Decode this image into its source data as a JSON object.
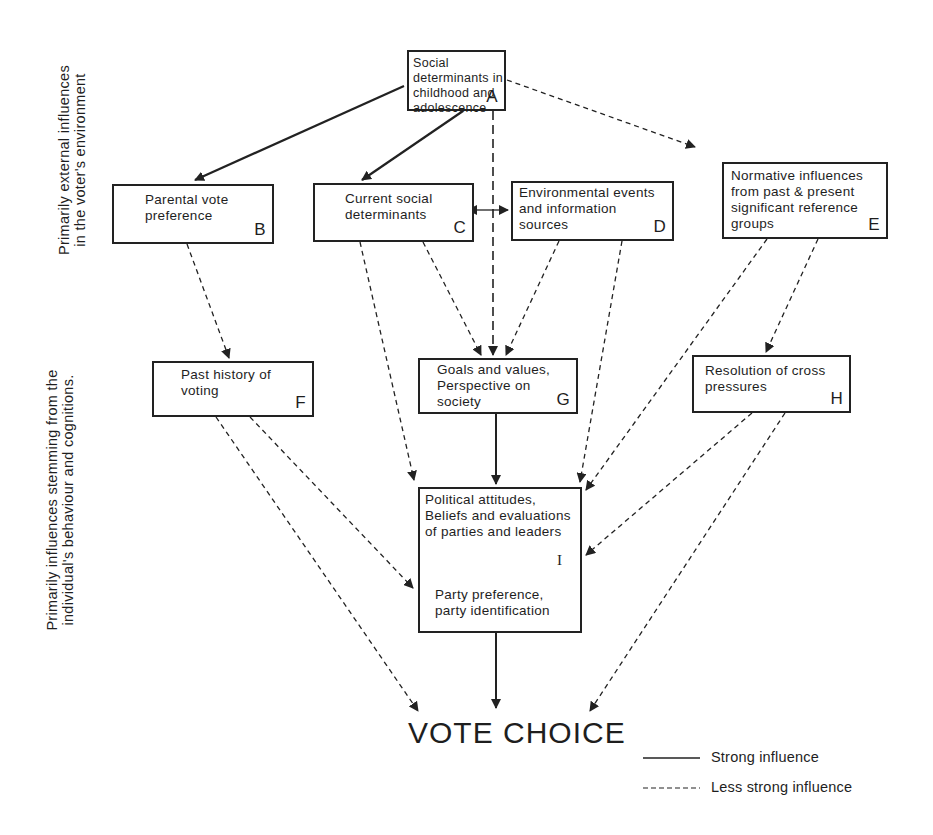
{
  "side_labels": {
    "top": "Primarily external influences\nin the voter's environment",
    "bottom": "Primarily influences stemming from the\nindividual's behaviour and cognitions."
  },
  "nodes": {
    "A": {
      "text": "Social determinants in\nchildhood and\nadolescence",
      "letter": "A"
    },
    "B": {
      "text": "Parental vote\npreference",
      "letter": "B"
    },
    "C": {
      "text": "Current social\ndeterminants",
      "letter": "C"
    },
    "D": {
      "text": "Environmental events\nand information\nsources",
      "letter": "D"
    },
    "E": {
      "text": "Normative influences\nfrom past & present\nsignificant reference\ngroups",
      "letter": "E"
    },
    "F": {
      "text": "Past history of\nvoting",
      "letter": "F"
    },
    "G": {
      "text": "Goals and values,\nPerspective on\nsociety",
      "letter": "G"
    },
    "H": {
      "text": "Resolution of cross\npressures",
      "letter": "H"
    },
    "I": {
      "top_text": "Political attitudes,\nBeliefs and evaluations\nof parties and leaders",
      "bottom_text": "Party preference,\nparty identification",
      "letter": "I"
    }
  },
  "outcome": "VOTE CHOICE",
  "legend": {
    "strong": "Strong influence",
    "less_strong": "Less strong influence"
  },
  "edges": [
    {
      "from": "A",
      "to": "B",
      "style": "strong"
    },
    {
      "from": "A",
      "to": "C",
      "style": "strong"
    },
    {
      "from": "A",
      "to": "G",
      "style": "less strong"
    },
    {
      "from": "A",
      "to": "E",
      "style": "less strong"
    },
    {
      "from": "C",
      "to": "D",
      "style": "less strong",
      "bidirectional": true
    },
    {
      "from": "B",
      "to": "F",
      "style": "less strong"
    },
    {
      "from": "C",
      "to": "G",
      "style": "less strong"
    },
    {
      "from": "C",
      "to": "I",
      "style": "less strong"
    },
    {
      "from": "D",
      "to": "G",
      "style": "less strong"
    },
    {
      "from": "D",
      "to": "I",
      "style": "less strong"
    },
    {
      "from": "E",
      "to": "I",
      "style": "less strong"
    },
    {
      "from": "E",
      "to": "H",
      "style": "less strong"
    },
    {
      "from": "G",
      "to": "I",
      "style": "strong"
    },
    {
      "from": "F",
      "to": "I",
      "style": "less strong"
    },
    {
      "from": "F",
      "to": "VOTE CHOICE",
      "style": "less strong"
    },
    {
      "from": "H",
      "to": "I",
      "style": "less strong"
    },
    {
      "from": "H",
      "to": "VOTE CHOICE",
      "style": "less strong"
    },
    {
      "from": "I",
      "to": "VOTE CHOICE",
      "style": "strong"
    }
  ]
}
